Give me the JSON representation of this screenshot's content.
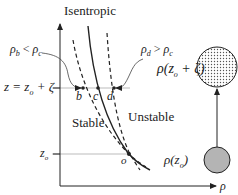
{
  "title": "Isentropic",
  "axes": {
    "y_label": "z",
    "x_label": "ρ"
  },
  "levels": {
    "upper": "z = z",
    "upper_sub": "o",
    "upper_rest": " + ζ",
    "lower": "z",
    "lower_sub": "o"
  },
  "regions": {
    "stable": "Stable",
    "unstable": "Unstable"
  },
  "points": {
    "b": "b",
    "c": "c",
    "d": "d",
    "o": "o"
  },
  "annotations": {
    "left": {
      "a": "ρ",
      "a_sub": "b",
      "op": " < ",
      "b": "ρ",
      "b_sub": "c"
    },
    "right": {
      "a": "ρ",
      "a_sub": "d",
      "op": " > ",
      "b": "ρ",
      "b_sub": "c"
    }
  },
  "parcels": {
    "top_label": "ρ(z",
    "top_sub": "o",
    "top_rest": " + ζ)",
    "bottom_label": "ρ(z",
    "bottom_sub": "o",
    "bottom_rest": ")"
  },
  "colors": {
    "ink": "#222222",
    "guide": "#aaaaaa",
    "dot": "#555555"
  }
}
